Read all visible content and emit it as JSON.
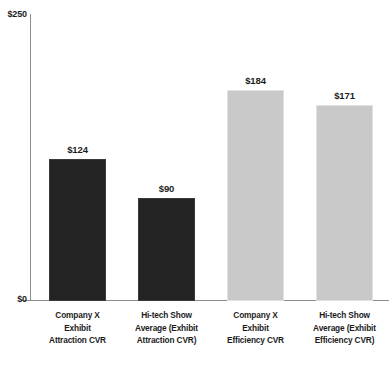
{
  "chart_data": {
    "type": "bar",
    "title": "",
    "subtitle": "",
    "xlabel": "",
    "ylabel": "",
    "ylim": [
      0,
      250
    ],
    "grid": false,
    "legend": null,
    "y_tick_labels": [
      "$0",
      "$250"
    ],
    "categories": [
      "Company X Exhibit Attraction CVR",
      "Hi-tech Show Average (Exhibit Attraction CVR)",
      "Company X Exhibit Efficiency CVR",
      "Hi-tech Show Average (Exhibit Efficiency CVR)"
    ],
    "values": [
      124,
      90,
      184,
      171
    ],
    "value_labels": [
      "$124",
      "$90",
      "$184",
      "$171"
    ],
    "bar_colors": [
      "#232323",
      "#232323",
      "#c9c9c9",
      "#c9c9c9"
    ]
  },
  "axis": {
    "y_top_label": "$250",
    "y_bottom_label": "$0"
  },
  "bars": [
    {
      "value_label": "$124",
      "category_lines": [
        "Company X",
        "Exhibit",
        "Attraction CVR"
      ]
    },
    {
      "value_label": "$90",
      "category_lines": [
        "Hi-tech Show",
        "Average (Exhibit",
        "Attraction CVR)"
      ]
    },
    {
      "value_label": "$184",
      "category_lines": [
        "Company X",
        "Exhibit",
        "Efficiency CVR"
      ]
    },
    {
      "value_label": "$171",
      "category_lines": [
        "Hi-tech Show",
        "Average (Exhibit",
        "Efficiency CVR)"
      ]
    }
  ]
}
